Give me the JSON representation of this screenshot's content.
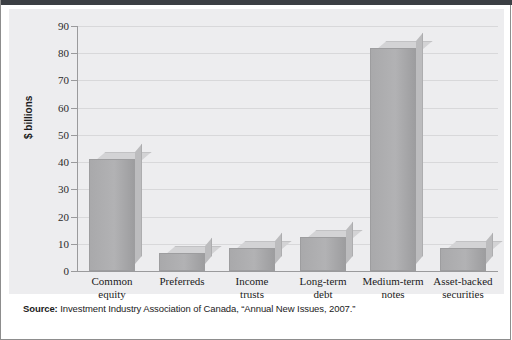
{
  "figure": {
    "source_prefix": "Source:",
    "source_text": " Investment Industry Association of Canada, “Annual New Issues, 2007.”"
  },
  "chart_data": {
    "type": "bar",
    "title": "",
    "xlabel": "",
    "ylabel": "$ billions",
    "ylim": [
      0,
      90
    ],
    "ytick_step": 10,
    "yticks": [
      0,
      10,
      20,
      30,
      40,
      50,
      60,
      70,
      80,
      90
    ],
    "ytick_labels": [
      "0",
      "10",
      "20",
      "30",
      "40",
      "50",
      "60",
      "70",
      "80",
      "90"
    ],
    "grid": true,
    "legend": null,
    "categories": [
      "Common equity",
      "Preferreds",
      "Income trusts",
      "Long-term debt",
      "Medium-term notes",
      "Asset-backed securities"
    ],
    "category_lines": [
      [
        "Common",
        "equity"
      ],
      [
        "Preferreds"
      ],
      [
        "Income",
        "trusts"
      ],
      [
        "Long-term",
        "debt"
      ],
      [
        "Medium-term",
        "notes"
      ],
      [
        "Asset-backed",
        "securities"
      ]
    ],
    "values": [
      41,
      6.5,
      8.5,
      12.5,
      82,
      8.5
    ],
    "bar_color": "#aeaeb0",
    "bar_top_color": "#d3d3d5",
    "bar_side_color": "#bcbcbe",
    "plot_background": "#ededef",
    "gridline_color": "#d8d8da",
    "axis_color": "#9a9a9c"
  }
}
